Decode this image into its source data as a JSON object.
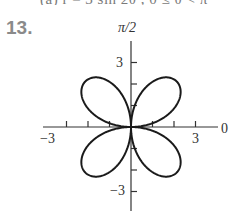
{
  "header": {
    "clipped_line": "(a)   r = 3 sin 2θ , 0 ≤ θ < π",
    "problem_number": "13."
  },
  "chart_data": {
    "type": "polar",
    "equation": "r = 3 sin(2θ)",
    "curve": "four-petal rose",
    "petal_count": 4,
    "petal_max_r": 3,
    "petal_angles_deg": [
      45,
      135,
      225,
      315
    ],
    "axes": {
      "polar_axis_label": "0",
      "vertical_axis_label": "π/2",
      "x_ticks": [
        -3,
        -2,
        -1,
        1,
        2,
        3
      ],
      "y_ticks": [
        -3,
        -2,
        -1,
        1,
        2,
        3
      ],
      "x_tick_labels": [
        "−3",
        "3"
      ],
      "y_tick_labels": [
        "3",
        "−3"
      ],
      "x_range": [
        -4,
        4
      ],
      "y_range": [
        -4,
        4
      ]
    },
    "grid": false
  },
  "style": {
    "curve_color": "#1a1a1a",
    "axis_color": "#333333",
    "label_color": "#333333",
    "number_color": "#8a8a8a"
  }
}
